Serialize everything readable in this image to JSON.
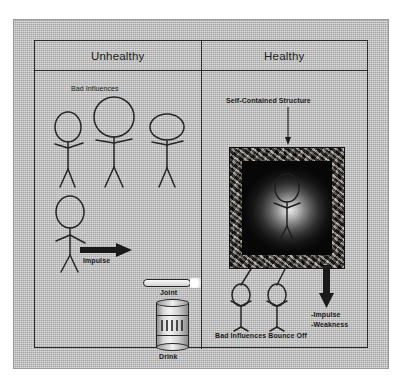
{
  "diagram": {
    "title_unhealthy": "Unhealthy",
    "title_healthy": "Healthy",
    "columns": [
      {
        "id": "unhealthy",
        "header": "Unhealthy"
      },
      {
        "id": "healthy",
        "header": "Healthy"
      }
    ]
  },
  "unhealthy_panel": {
    "bad_influences_label": "Bad Influences",
    "impulse_label": "Impulse",
    "joint_label": "Joint",
    "drink_label": "Drink",
    "figures": [
      {
        "name": "bad-influence-figure-1",
        "head": "tall-oval"
      },
      {
        "name": "bad-influence-figure-2",
        "head": "large-circle"
      },
      {
        "name": "bad-influence-figure-3",
        "head": "wide-oval"
      },
      {
        "name": "person-figure",
        "head": "oval"
      }
    ]
  },
  "healthy_panel": {
    "self_contained_label": "Self-Contained Structure",
    "bounce_off_label": "Bad Influences Bounce Off",
    "impulse_label": "-Impulse",
    "weakness_label": "-Weakness",
    "figures": [
      {
        "name": "protected-figure",
        "head": "oval"
      },
      {
        "name": "bounced-figure-1",
        "head": "oval"
      },
      {
        "name": "bounced-figure-2",
        "head": "oval"
      }
    ]
  },
  "colors": {
    "canvas": "#b8b8b8",
    "ink": "#262626",
    "stone_frame": "#4a4338",
    "interior_core": "#e9e9e9",
    "interior_edge": "#070707"
  }
}
